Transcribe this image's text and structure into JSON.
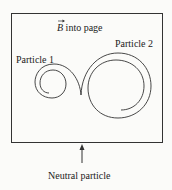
{
  "figure": {
    "field_label_symbol": "B",
    "field_label_text": " into page",
    "particle1_label": "Particle 1",
    "particle2_label": "Particle 2",
    "neutral_label": "Neutral particle"
  }
}
